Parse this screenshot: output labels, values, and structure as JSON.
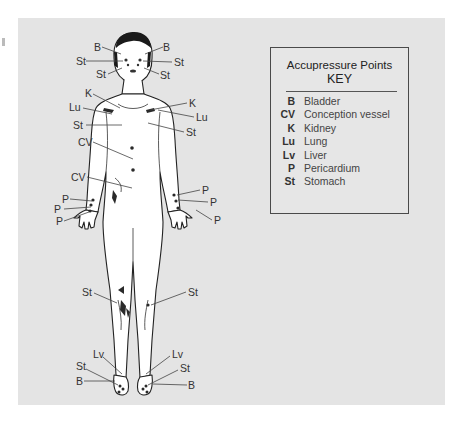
{
  "diagram": {
    "colors": {
      "panel_bg": "#e4e4e4",
      "outline": "#222222",
      "skin": "#ffffff",
      "leader": "#444444"
    },
    "key": {
      "title": "Accupressure Points",
      "subtitle": "KEY",
      "entries": [
        {
          "code": "B",
          "name": "Bladder"
        },
        {
          "code": "CV",
          "name": "Conception vessel"
        },
        {
          "code": "K",
          "name": "Kidney"
        },
        {
          "code": "Lu",
          "name": "Lung"
        },
        {
          "code": "Lv",
          "name": "Liver"
        },
        {
          "code": "P",
          "name": "Pericardium"
        },
        {
          "code": "St",
          "name": "Stomach"
        }
      ]
    },
    "labels": {
      "head_b_left": "B",
      "head_b_right": "B",
      "head_st1_left": "St",
      "head_st1_right": "St",
      "head_st2_left": "St",
      "head_st2_right": "St",
      "k_left": "K",
      "k_right": "K",
      "lu_left": "Lu",
      "lu_right": "Lu",
      "st_chest_left": "St",
      "st_chest_right": "St",
      "cv_upper": "CV",
      "cv_lower": "CV",
      "p_left_1": "P",
      "p_left_2": "P",
      "p_left_3": "P",
      "p_right_1": "P",
      "p_right_2": "P",
      "p_right_3": "P",
      "st_knee_left": "St",
      "st_knee_right": "St",
      "lv_left": "Lv",
      "lv_right": "Lv",
      "st_foot_left": "St",
      "st_foot_right": "St",
      "b_foot_left": "B",
      "b_foot_right": "B"
    }
  }
}
